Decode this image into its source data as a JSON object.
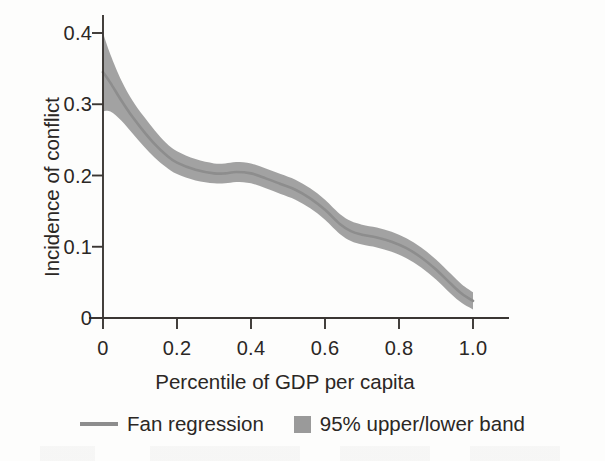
{
  "chart_data": {
    "type": "line",
    "title": "",
    "subtitle": "",
    "xlabel": "Percentile of GDP per capita",
    "ylabel": "Incidence of conflict",
    "xlim": [
      0,
      1.0
    ],
    "ylim": [
      0,
      0.4
    ],
    "grid": false,
    "legend_position": "bottom",
    "xticks": [
      "0",
      "0.2",
      "0.4",
      "0.6",
      "0.8",
      "1.0"
    ],
    "xtick_values": [
      0,
      0.2,
      0.4,
      0.6,
      0.8,
      1.0
    ],
    "yticks": [
      "0",
      "0.1",
      "0.2",
      "0.3",
      "0.4"
    ],
    "ytick_values": [
      0,
      0.1,
      0.2,
      0.3,
      0.4
    ],
    "x": [
      0.0,
      0.02,
      0.05,
      0.08,
      0.11,
      0.14,
      0.17,
      0.2,
      0.25,
      0.3,
      0.33,
      0.36,
      0.4,
      0.44,
      0.48,
      0.52,
      0.56,
      0.6,
      0.64,
      0.67,
      0.7,
      0.74,
      0.78,
      0.82,
      0.86,
      0.9,
      0.94,
      0.97,
      1.0
    ],
    "series": [
      {
        "name": "Fan regression",
        "color": "#8d8d8d",
        "values": [
          0.345,
          0.33,
          0.305,
          0.282,
          0.262,
          0.244,
          0.229,
          0.218,
          0.208,
          0.203,
          0.203,
          0.205,
          0.203,
          0.196,
          0.188,
          0.18,
          0.168,
          0.152,
          0.132,
          0.122,
          0.117,
          0.113,
          0.107,
          0.098,
          0.085,
          0.068,
          0.048,
          0.034,
          0.024
        ]
      },
      {
        "name": "95% upper band",
        "color": "#9a9a9a",
        "values": [
          0.4,
          0.37,
          0.333,
          0.305,
          0.283,
          0.263,
          0.246,
          0.234,
          0.223,
          0.217,
          0.217,
          0.219,
          0.217,
          0.21,
          0.202,
          0.194,
          0.182,
          0.166,
          0.146,
          0.136,
          0.131,
          0.127,
          0.121,
          0.112,
          0.099,
          0.082,
          0.062,
          0.047,
          0.036
        ]
      },
      {
        "name": "95% lower band",
        "color": "#9a9a9a",
        "values": [
          0.29,
          0.29,
          0.277,
          0.259,
          0.241,
          0.225,
          0.212,
          0.202,
          0.193,
          0.189,
          0.189,
          0.191,
          0.189,
          0.182,
          0.174,
          0.166,
          0.154,
          0.138,
          0.118,
          0.108,
          0.103,
          0.099,
          0.093,
          0.084,
          0.071,
          0.054,
          0.034,
          0.021,
          0.012
        ]
      }
    ],
    "legend": [
      {
        "label": "Fan regression",
        "marker": "line",
        "color": "#8d8d8d"
      },
      {
        "label": "95% upper/lower band",
        "marker": "square",
        "color": "#9a9a9a"
      }
    ]
  }
}
